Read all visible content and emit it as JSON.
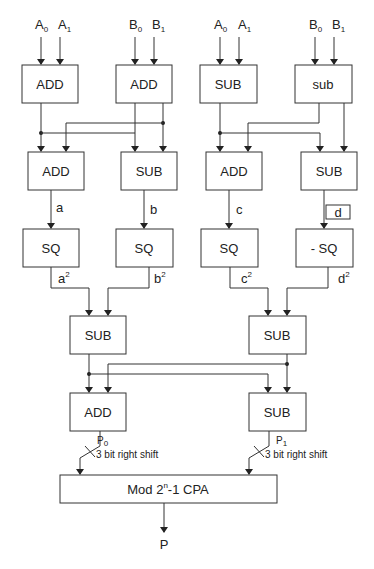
{
  "inputs": {
    "left_add": [
      "A",
      "A"
    ],
    "left_add_sub": [
      "0",
      "1"
    ],
    "right_add": [
      "B",
      "B"
    ],
    "right_add_sub": [
      "0",
      "1"
    ],
    "left_sub": [
      "A",
      "A"
    ],
    "left_sub_sub": [
      "0",
      "1"
    ],
    "right_sub": [
      "B",
      "B"
    ],
    "right_sub_sub": [
      "0",
      "1"
    ]
  },
  "row1": [
    "ADD",
    "ADD",
    "SUB",
    "sub"
  ],
  "row2": [
    "ADD",
    "SUB",
    "ADD",
    "SUB"
  ],
  "row2_outputs": [
    "a",
    "b",
    "c",
    "d"
  ],
  "row3": [
    "SQ",
    "SQ",
    "SQ",
    "- SQ"
  ],
  "row3_outputs": [
    {
      "base": "a",
      "exp": "2"
    },
    {
      "base": "b",
      "exp": "2"
    },
    {
      "base": "c",
      "exp": "2"
    },
    {
      "base": "d",
      "exp": "2"
    }
  ],
  "row4": [
    "SUB",
    "SUB"
  ],
  "row5": [
    "ADD",
    "SUB"
  ],
  "row5_outputs": [
    {
      "base": "P",
      "sub": "0",
      "note": "3 bit right shift"
    },
    {
      "base": "P",
      "sub": "1",
      "note": "3 bit right shift"
    }
  ],
  "cpa": {
    "prefix": "Mod 2",
    "exp": "n",
    "suffix": "-1 CPA"
  },
  "output": "P"
}
